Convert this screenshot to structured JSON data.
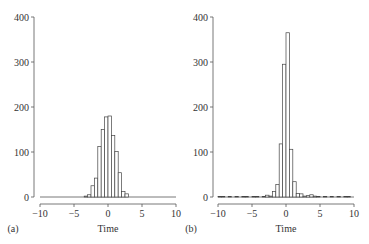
{
  "chart_data": [
    {
      "type": "bar",
      "panel_label": "(a)",
      "title": "",
      "xlabel": "Time",
      "ylabel": "",
      "xlim": [
        -10,
        10
      ],
      "ylim": [
        0,
        400
      ],
      "xticks": [
        -10,
        -5,
        0,
        5,
        10
      ],
      "yticks": [
        0,
        100,
        200,
        300,
        400
      ],
      "grid": false,
      "bin_width": 0.5,
      "bins": [
        -3.5,
        -3.0,
        -2.5,
        -2.0,
        -1.5,
        -1.0,
        -0.5,
        0.0,
        0.5,
        1.0,
        1.5,
        2.0,
        2.5
      ],
      "values": [
        2,
        5,
        25,
        42,
        112,
        150,
        178,
        180,
        137,
        101,
        54,
        12,
        7
      ]
    },
    {
      "type": "bar",
      "panel_label": "(b)",
      "title": "",
      "xlabel": "Time",
      "ylabel": "",
      "xlim": [
        -10,
        10
      ],
      "ylim": [
        0,
        400
      ],
      "xticks": [
        -10,
        -5,
        0,
        5,
        10
      ],
      "yticks": [
        0,
        100,
        200,
        300,
        400
      ],
      "grid": false,
      "bin_width": 0.5,
      "bins": [
        -10.0,
        -9.5,
        -9.0,
        -8.5,
        -8.0,
        -7.5,
        -7.0,
        -6.5,
        -6.0,
        -5.5,
        -5.0,
        -4.5,
        -4.0,
        -3.5,
        -3.0,
        -2.5,
        -2.0,
        -1.5,
        -1.0,
        -0.5,
        0.0,
        0.5,
        1.0,
        1.5,
        2.0,
        2.5,
        3.0,
        3.5,
        4.0,
        4.5,
        5.0,
        5.5,
        6.0,
        6.5,
        7.0,
        7.5,
        8.0,
        8.5,
        9.0,
        9.5
      ],
      "values": [
        1,
        1,
        0,
        1,
        0,
        1,
        0,
        1,
        1,
        0,
        1,
        1,
        0,
        1,
        4,
        2,
        12,
        28,
        118,
        295,
        365,
        106,
        34,
        8,
        7,
        2,
        3,
        5,
        2,
        1,
        0,
        1,
        0,
        1,
        0,
        1,
        0,
        1,
        1,
        0
      ]
    }
  ]
}
